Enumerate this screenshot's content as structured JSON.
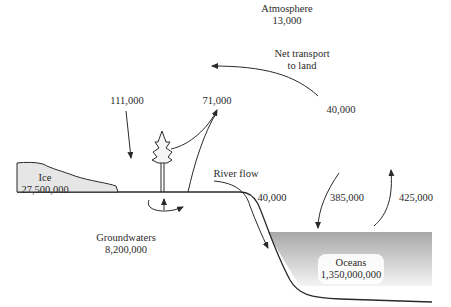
{
  "diagram": {
    "type": "water-cycle",
    "reservoirs": {
      "atmosphere": {
        "name": "Atmosphere",
        "value": "13,000"
      },
      "ice": {
        "name": "Ice",
        "value": "27,500,000"
      },
      "groundwaters": {
        "name": "Groundwaters",
        "value": "8,200,000"
      },
      "oceans": {
        "name": "Oceans",
        "value": "1,350,000,000"
      }
    },
    "fluxes": {
      "precip_land": "111,000",
      "evapotranspiration_land": "71,000",
      "net_transport": {
        "label_line1": "Net transport",
        "label_line2": "to land",
        "value": "40,000"
      },
      "river_flow": {
        "label": "River flow",
        "value": "40,000"
      },
      "precip_ocean": "385,000",
      "evap_ocean": "425,000"
    },
    "colors": {
      "ink": "#2a2a2a",
      "ice_fill": "#e6e6e6",
      "ocean_top": "#a9a9a9",
      "ocean_bottom": "#ffffff"
    }
  }
}
